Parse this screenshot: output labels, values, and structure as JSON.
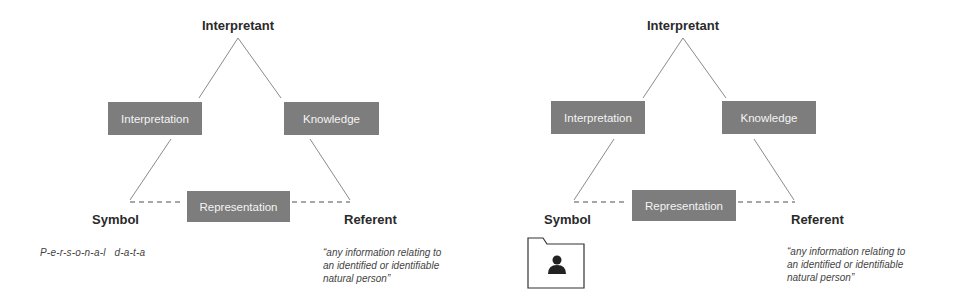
{
  "diagrams": [
    {
      "apex_label": "Interpretant",
      "left_box": "Interpretation",
      "right_box": "Knowledge",
      "bottom_box": "Representation",
      "left_corner": "Symbol",
      "right_corner": "Referent",
      "symbol_example": "P-e-r-s-o-n-a-l   d-a-t-a",
      "referent_definition": [
        "“any information relating to",
        "an identified or identifiable",
        "natural person”"
      ]
    },
    {
      "apex_label": "Interpretant",
      "left_box": "Interpretation",
      "right_box": "Knowledge",
      "bottom_box": "Representation",
      "left_corner": "Symbol",
      "right_corner": "Referent",
      "symbol_icon": "person-folder-icon",
      "referent_definition": [
        "“any information relating to",
        "an identified or identifiable",
        "natural person”"
      ]
    }
  ],
  "colors": {
    "box_fill": "#7d7d7d",
    "box_text": "#f4f4f4",
    "line": "#8a8a8a"
  }
}
